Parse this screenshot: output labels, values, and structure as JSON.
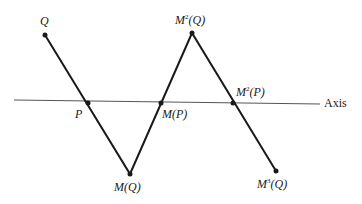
{
  "diagram": {
    "axis_label": "Axis",
    "labels": {
      "Q": {
        "base": "",
        "sup": "",
        "arg": "Q"
      },
      "P": {
        "base": "",
        "sup": "",
        "arg": "P"
      },
      "MQ": {
        "base": "M",
        "sup": "",
        "arg": "(Q)"
      },
      "MP": {
        "base": "M",
        "sup": "",
        "arg": "(P)"
      },
      "M2Q": {
        "base": "M",
        "sup": "2",
        "arg": "(Q)"
      },
      "M2P": {
        "base": "M",
        "sup": "2",
        "arg": "(P)"
      },
      "M3Q": {
        "base": "M",
        "sup": "3",
        "arg": "(Q)"
      }
    },
    "points": {
      "Q": [
        45,
        35
      ],
      "P": [
        88,
        103
      ],
      "MQ": [
        130,
        174
      ],
      "MP": [
        161,
        103
      ],
      "M2Q": [
        192,
        33
      ],
      "M2P": [
        233,
        103
      ],
      "M3Q": [
        276,
        171
      ]
    },
    "colors": {
      "line": "#1a1a1a",
      "axis": "#555555"
    }
  }
}
